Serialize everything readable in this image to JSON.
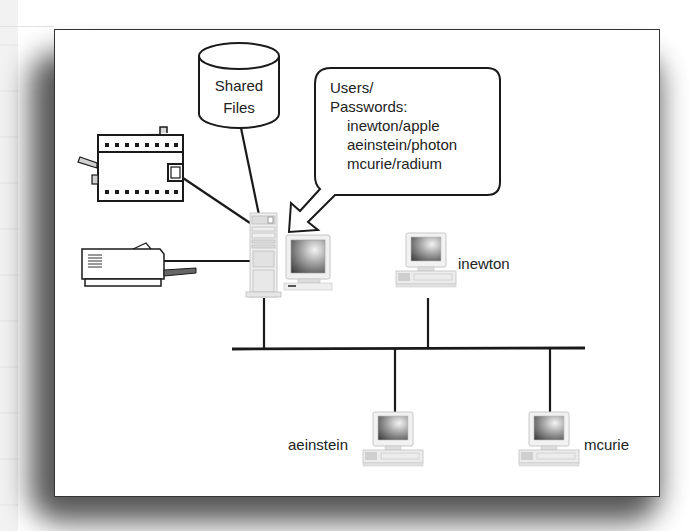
{
  "diagram": {
    "type": "network-diagram",
    "shared_storage": {
      "icon": "database-cylinder-icon",
      "label_line1": "Shared",
      "label_line2": "Files"
    },
    "callout": {
      "title_line1": "Users/",
      "title_line2": "Passwords:",
      "credentials": [
        "inewton/apple",
        "aeinstein/photon",
        "mcurie/radium"
      ]
    },
    "devices": {
      "server": {
        "icon": "server-tower-icon",
        "monitor_icon": "monitor-icon"
      },
      "fax": {
        "icon": "fax-machine-icon"
      },
      "printer": {
        "icon": "printer-icon"
      }
    },
    "clients": [
      {
        "name": "inewton",
        "icon": "workstation-icon"
      },
      {
        "name": "aeinstein",
        "icon": "workstation-icon"
      },
      {
        "name": "mcurie",
        "icon": "workstation-icon"
      }
    ],
    "network": {
      "type": "bus",
      "icon": "network-bus"
    }
  }
}
